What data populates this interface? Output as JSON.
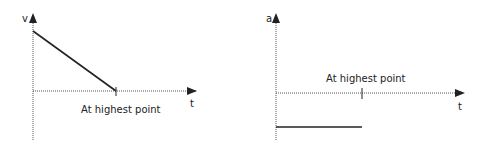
{
  "left_graph": {
    "y_label": "v",
    "x_label": "t",
    "annotation": "At highest point",
    "description": "Velocity decreases linearly from initial value to zero at the highest point"
  },
  "right_graph": {
    "y_label": "a",
    "x_label": "t",
    "annotation": "At highest point",
    "description": "Acceleration is constant and negative, unchanged at the highest point"
  },
  "colors": {
    "axis": "#555555",
    "line": "#222222"
  }
}
